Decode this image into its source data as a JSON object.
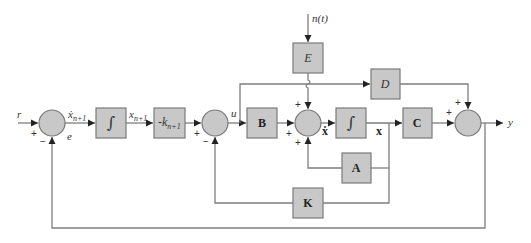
{
  "diagram": {
    "signals": {
      "reference": "r",
      "error": "e",
      "xi_dot": "ẋ",
      "xi_dot_sub": "n+1",
      "xi": "x",
      "xi_sub": "n+1",
      "control": "u",
      "state_dot": "ẋ",
      "state": "x",
      "output": "y",
      "disturbance": "n(t)"
    },
    "blocks": {
      "integrator1": "∫",
      "gain_k": "-k",
      "gain_k_sub": "n+1",
      "B": "B",
      "E": "E",
      "integrator2": "∫",
      "A": "A",
      "C": "C",
      "D": "D",
      "K": "K"
    },
    "signs": {
      "sum1_ref": "+",
      "sum1_fb": "−",
      "sum2_in": "+",
      "sum2_fb": "−",
      "sum3_B": "+",
      "sum3_E": "+",
      "sum3_A": "+",
      "sum4_C": "+",
      "sum4_D": "+"
    },
    "colors": {
      "block_fill": "#c8c8c8",
      "line": "#7d7d7d",
      "arrow": "#222222"
    }
  }
}
